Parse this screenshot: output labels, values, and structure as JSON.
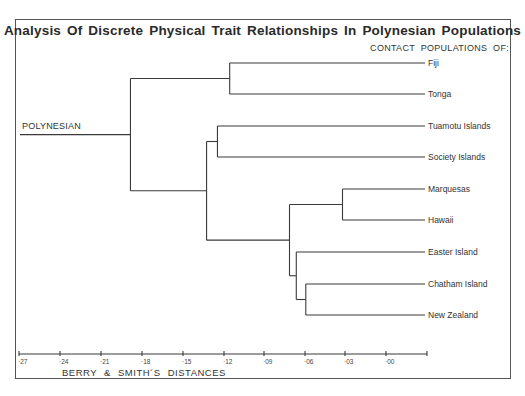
{
  "chart_data": {
    "type": "dendrogram",
    "title": "Analysis Of Discrete Physical Trait Relationships In Polynesian Populations",
    "root_label": "POLYNESIAN",
    "leaf_header": "CONTACT POPULATIONS OF:",
    "xlabel": "BERRY & SMITH´S  DISTANCES",
    "x_ticks": [
      "·27",
      "·24",
      "·21",
      "·18",
      "·15",
      "·12",
      "·09",
      "·06",
      "·03",
      "·00"
    ],
    "x_tick_values": [
      0.27,
      0.24,
      0.21,
      0.18,
      0.15,
      0.12,
      0.09,
      0.06,
      0.03,
      0.0
    ],
    "xlim": [
      0.27,
      -0.03
    ],
    "leaves": [
      "Fiji",
      "Tonga",
      "Tuamotu Islands",
      "Society Islands",
      "Marquesas",
      "Hawaii",
      "Easter Island",
      "Chatham Island",
      "New Zealand"
    ],
    "merges": [
      {
        "members": [
          "Marquesas",
          "Hawaii"
        ],
        "distance": 0.032
      },
      {
        "members": [
          "Chatham Island",
          "New Zealand"
        ],
        "distance": 0.059
      },
      {
        "members": [
          "Easter Island",
          "Chatham Island+New Zealand"
        ],
        "distance": 0.066
      },
      {
        "members": [
          "Marquesas+Hawaii",
          "Easter Island+Chatham Island+New Zealand"
        ],
        "distance": 0.071
      },
      {
        "members": [
          "Fiji",
          "Tonga"
        ],
        "distance": 0.115
      },
      {
        "members": [
          "Tuamotu Islands",
          "Society Islands"
        ],
        "distance": 0.124
      },
      {
        "members": [
          "Tuamotu Islands+Society Islands",
          "Marquesas+Hawaii+Easter Island+Chatham Island+New Zealand"
        ],
        "distance": 0.132
      },
      {
        "members": [
          "Fiji+Tonga",
          "Tuamotu+Society+Marquesas+Hawaii+Easter+Chatham+New Zealand"
        ],
        "distance": 0.188
      }
    ],
    "grid": false
  },
  "layout": {
    "leaf_y": [
      63,
      94,
      126,
      157,
      189,
      220,
      252,
      284,
      315
    ],
    "leaf_end_x": 425,
    "axis": {
      "y": 354,
      "x_start": 19,
      "x_end": 427,
      "tick_x": [
        19,
        60,
        101,
        142,
        183,
        224,
        264,
        305,
        345,
        386
      ]
    },
    "line_color": "#3a3a3a"
  }
}
